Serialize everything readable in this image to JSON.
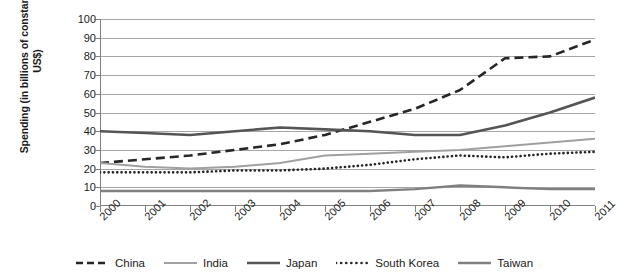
{
  "chart_data": {
    "type": "line",
    "title": "",
    "xlabel": "",
    "ylabel": "Spending (in billions of constant 2011 US$)",
    "ylabel_line1": "Spending (in billions of constant 2011",
    "ylabel_line2": "US$)",
    "ylim": [
      0,
      100
    ],
    "ytick_step": 10,
    "yticks": [
      "0",
      "10",
      "20",
      "30",
      "40",
      "50",
      "60",
      "70",
      "80",
      "90",
      "100"
    ],
    "grid": true,
    "grid_axis": "y",
    "legend_position": "bottom",
    "categories": [
      "2000",
      "2001",
      "2002",
      "2003",
      "2004",
      "2005",
      "2006",
      "2007",
      "2008",
      "2009",
      "2010",
      "2011"
    ],
    "series": [
      {
        "name": "China",
        "color": "#262626",
        "style": "dashed",
        "width": 2.6,
        "values": [
          23,
          25,
          27,
          30,
          33,
          38,
          45,
          52,
          62,
          79,
          80,
          89
        ]
      },
      {
        "name": "India",
        "color": "#a0a0a0",
        "style": "solid",
        "width": 2.0,
        "values": [
          23,
          21,
          20,
          21,
          23,
          27,
          28,
          29,
          30,
          32,
          34,
          36
        ]
      },
      {
        "name": "Japan",
        "color": "#555555",
        "style": "solid",
        "width": 2.6,
        "values": [
          40,
          39,
          38,
          40,
          42,
          41,
          40,
          38,
          38,
          43,
          50,
          58
        ]
      },
      {
        "name": "South Korea",
        "color": "#262626",
        "style": "dotted",
        "width": 2.6,
        "values": [
          18,
          18,
          18,
          19,
          19,
          20,
          22,
          25,
          27,
          26,
          28,
          29
        ]
      },
      {
        "name": "Taiwan",
        "color": "#808080",
        "style": "solid",
        "width": 2.4,
        "values": [
          8,
          8,
          8,
          8,
          8,
          8,
          8,
          9,
          11,
          10,
          9,
          9
        ]
      }
    ]
  },
  "legend": {
    "items": [
      {
        "label": "China"
      },
      {
        "label": "India"
      },
      {
        "label": "Japan"
      },
      {
        "label": "South Korea"
      },
      {
        "label": "Taiwan"
      }
    ]
  }
}
